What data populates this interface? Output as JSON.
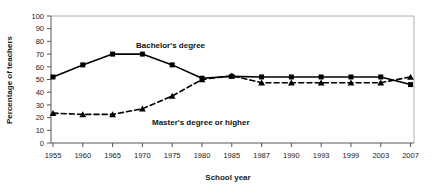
{
  "chart_data": {
    "type": "line",
    "title": "",
    "xlabel": "School year",
    "ylabel": "Percentage of teachers",
    "categories": [
      "1955",
      "1960",
      "1965",
      "1970",
      "1975",
      "1980",
      "1985",
      "1987",
      "1990",
      "1993",
      "1999",
      "2003",
      "2007"
    ],
    "x_tick_labels": [
      "1955",
      "1960",
      "1965",
      "1970",
      "1975",
      "1980",
      "1985",
      "1987",
      "1990",
      "1993",
      "1999",
      "2003",
      "2007"
    ],
    "y_tick_labels": [
      "0",
      "10",
      "20",
      "30",
      "40",
      "50",
      "60",
      "70",
      "80",
      "90",
      "100"
    ],
    "ylim": [
      0,
      100
    ],
    "y_tick_step": 10,
    "grid": false,
    "legend_position": "inline-annotation",
    "series": [
      {
        "name": "Bachelor's degree",
        "marker": "square",
        "line_style": "solid",
        "color": "#000000",
        "values": [
          52,
          61.5,
          70,
          70,
          61.5,
          51,
          52.5,
          52,
          52,
          52,
          52,
          52,
          46
        ]
      },
      {
        "name": "Master's degree or higher",
        "marker": "triangle",
        "line_style": "dashed",
        "color": "#000000",
        "values": [
          23.5,
          22.5,
          22.5,
          27,
          37,
          50,
          53,
          47.5,
          47.5,
          47.5,
          47.5,
          47.5,
          52
        ]
      }
    ],
    "annotations": [
      {
        "text": "Bachelor's degree",
        "series": "Bachelor's degree"
      },
      {
        "text": "Master's degree or higher",
        "series": "Master's degree or higher"
      }
    ]
  },
  "axes": {
    "y_axis_title": "Percentage of teachers",
    "x_axis_title": "School year"
  },
  "colors": {
    "ink": "#000000",
    "axis": "#555555",
    "background": "#ffffff"
  }
}
